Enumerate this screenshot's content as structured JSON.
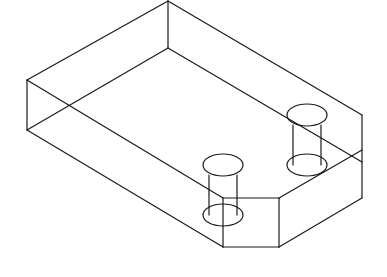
{
  "figure": {
    "title": "",
    "stroke_color": "#1a1a1a",
    "background": "#ffffff"
  },
  "edges": [
    {
      "x1": 168,
      "y1": 1,
      "x2": 27,
      "y2": 80
    },
    {
      "x1": 168,
      "y1": 1,
      "x2": 362,
      "y2": 115
    },
    {
      "x1": 168,
      "y1": 1,
      "x2": 168,
      "y2": 48
    },
    {
      "x1": 168,
      "y1": 48,
      "x2": 27,
      "y2": 130
    },
    {
      "x1": 168,
      "y1": 48,
      "x2": 362,
      "y2": 162
    },
    {
      "x1": 27,
      "y1": 80,
      "x2": 27,
      "y2": 130
    },
    {
      "x1": 27,
      "y1": 80,
      "x2": 223,
      "y2": 198
    },
    {
      "x1": 27,
      "y1": 130,
      "x2": 223,
      "y2": 247
    },
    {
      "x1": 223,
      "y1": 198,
      "x2": 279,
      "y2": 198
    },
    {
      "x1": 223,
      "y1": 198,
      "x2": 223,
      "y2": 247
    },
    {
      "x1": 223,
      "y1": 247,
      "x2": 279,
      "y2": 247
    },
    {
      "x1": 279,
      "y1": 198,
      "x2": 279,
      "y2": 247
    },
    {
      "x1": 279,
      "y1": 198,
      "x2": 362,
      "y2": 150
    },
    {
      "x1": 279,
      "y1": 247,
      "x2": 362,
      "y2": 198
    },
    {
      "x1": 362,
      "y1": 115,
      "x2": 362,
      "y2": 198
    }
  ],
  "holes": [
    {
      "name": "left-hole",
      "cx": 223,
      "top_cy": 165,
      "bottom_cy": 215,
      "rx": 20,
      "ry": 11
    },
    {
      "name": "right-hole",
      "cx": 307,
      "top_cy": 115,
      "bottom_cy": 165,
      "rx": 20,
      "ry": 11
    }
  ]
}
